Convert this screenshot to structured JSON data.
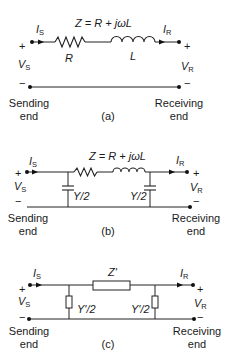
{
  "figure": {
    "panels": [
      {
        "id": "a",
        "caption": "(a)",
        "series_impedance": "Z = R + jωL",
        "resistor_label": "R",
        "inductor_label": "L",
        "sending_current": "I",
        "sending_current_sub": "S",
        "receiving_current": "I",
        "receiving_current_sub": "R",
        "sending_voltage": "V",
        "sending_voltage_sub": "S",
        "receiving_voltage": "V",
        "receiving_voltage_sub": "R",
        "plus": "+",
        "minus": "−",
        "sending_end_line1": "Sending",
        "sending_end_line2": "end",
        "receiving_end_line1": "Receiving",
        "receiving_end_line2": "end"
      },
      {
        "id": "b",
        "caption": "(b)",
        "series_impedance": "Z = R + jωL",
        "shunt_left_label": "Y/2",
        "shunt_right_label": "Y/2",
        "sending_current": "I",
        "sending_current_sub": "S",
        "receiving_current": "I",
        "receiving_current_sub": "R",
        "sending_voltage": "V",
        "sending_voltage_sub": "S",
        "receiving_voltage": "V",
        "receiving_voltage_sub": "R",
        "plus": "+",
        "minus": "−",
        "sending_end_line1": "Sending",
        "sending_end_line2": "end",
        "receiving_end_line1": "Receiving",
        "receiving_end_line2": "end"
      },
      {
        "id": "c",
        "caption": "(c)",
        "series_impedance": "Z'",
        "shunt_left_label": "Y'/2",
        "shunt_right_label": "Y'/2",
        "sending_current": "I",
        "sending_current_sub": "S",
        "receiving_current": "I",
        "receiving_current_sub": "R",
        "sending_voltage": "V",
        "sending_voltage_sub": "S",
        "receiving_voltage": "V",
        "receiving_voltage_sub": "R",
        "plus": "+",
        "minus": "−",
        "sending_end_line1": "Sending",
        "sending_end_line2": "end",
        "receiving_end_line1": "Receiving",
        "receiving_end_line2": "end"
      }
    ]
  }
}
